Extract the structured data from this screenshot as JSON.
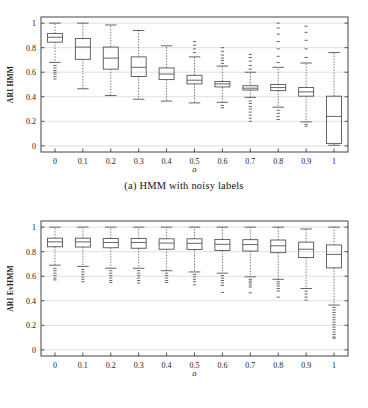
{
  "figure": {
    "caption_a": "(a) HMM with noisy labels",
    "caption_b": "(b) EvHMM with noisy labels"
  },
  "chart_data": [
    {
      "id": "hmm",
      "type": "box",
      "title": "(a) HMM with noisy labels",
      "xlabel": "ρ",
      "ylabel": "ARI HMM",
      "xtick_labels": [
        "0",
        "0.1",
        "0.2",
        "0.3",
        "0.4",
        "0.5",
        "0.6",
        "0.7",
        "0.8",
        "0.9",
        "1"
      ],
      "ytick_labels": [
        "0",
        "0.2",
        "0.4",
        "0.6",
        "0.8",
        "1"
      ],
      "ytick_values": [
        0,
        0.2,
        0.4,
        0.6,
        0.8,
        1
      ],
      "xlim": [
        -0.5,
        10.5
      ],
      "ylim": [
        -0.05,
        1.05
      ],
      "grid": true,
      "grid_axis": "y",
      "legend": "none",
      "categories": [
        0,
        0.1,
        0.2,
        0.3,
        0.4,
        0.5,
        0.6,
        0.7,
        0.8,
        0.9,
        1
      ],
      "boxes": [
        {
          "x": 0,
          "whisker_low": 0.68,
          "q1": 0.845,
          "median": 0.885,
          "q3": 0.915,
          "whisker_high": 1.0,
          "outliers_low": [
            0.655,
            0.635,
            0.615,
            0.6,
            0.585,
            0.565,
            0.545
          ],
          "outliers_high": []
        },
        {
          "x": 0.1,
          "whisker_low": 0.465,
          "q1": 0.705,
          "median": 0.805,
          "q3": 0.875,
          "whisker_high": 1.0,
          "outliers_low": [],
          "outliers_high": []
        },
        {
          "x": 0.2,
          "whisker_low": 0.41,
          "q1": 0.625,
          "median": 0.715,
          "q3": 0.805,
          "whisker_high": 0.985,
          "outliers_low": [],
          "outliers_high": []
        },
        {
          "x": 0.3,
          "whisker_low": 0.38,
          "q1": 0.565,
          "median": 0.64,
          "q3": 0.725,
          "whisker_high": 0.94,
          "outliers_low": [],
          "outliers_high": []
        },
        {
          "x": 0.4,
          "whisker_low": 0.365,
          "q1": 0.54,
          "median": 0.585,
          "q3": 0.635,
          "whisker_high": 0.815,
          "outliers_low": [],
          "outliers_high": []
        },
        {
          "x": 0.5,
          "whisker_low": 0.35,
          "q1": 0.505,
          "median": 0.535,
          "q3": 0.575,
          "whisker_high": 0.725,
          "outliers_low": [],
          "outliers_high": [
            0.76,
            0.79,
            0.82,
            0.85
          ]
        },
        {
          "x": 0.6,
          "whisker_low": 0.355,
          "q1": 0.48,
          "median": 0.505,
          "q3": 0.525,
          "whisker_high": 0.65,
          "outliers_low": [
            0.33,
            0.31
          ],
          "outliers_high": [
            0.672,
            0.695,
            0.715,
            0.74,
            0.77,
            0.8
          ]
        },
        {
          "x": 0.7,
          "whisker_low": 0.395,
          "q1": 0.455,
          "median": 0.47,
          "q3": 0.49,
          "whisker_high": 0.6,
          "outliers_low": [
            0.365,
            0.345,
            0.32,
            0.3,
            0.275,
            0.25,
            0.225,
            0.2
          ],
          "outliers_high": [
            0.625,
            0.655,
            0.69,
            0.72,
            0.745
          ]
        },
        {
          "x": 0.8,
          "whisker_low": 0.315,
          "q1": 0.45,
          "median": 0.475,
          "q3": 0.5,
          "whisker_high": 0.64,
          "outliers_low": [
            0.29,
            0.265,
            0.24,
            0.215
          ],
          "outliers_high": [
            0.68,
            0.73,
            0.79,
            0.85,
            0.91,
            0.96,
            1.0
          ]
        },
        {
          "x": 0.9,
          "whisker_low": 0.195,
          "q1": 0.405,
          "median": 0.44,
          "q3": 0.475,
          "whisker_high": 0.675,
          "outliers_low": [
            0.175,
            0.16
          ],
          "outliers_high": [
            0.72,
            0.79,
            0.86,
            0.925,
            0.975
          ]
        },
        {
          "x": 1,
          "whisker_low": 0.005,
          "q1": 0.02,
          "median": 0.24,
          "q3": 0.405,
          "whisker_high": 0.76,
          "outliers_low": [],
          "outliers_high": []
        }
      ]
    },
    {
      "id": "evhmm",
      "type": "box",
      "title": "(b) EvHMM with noisy labels",
      "xlabel": "ρ",
      "ylabel": "ARI EvHMM",
      "xtick_labels": [
        "0",
        "0.1",
        "0.2",
        "0.3",
        "0.4",
        "0.5",
        "0.6",
        "0.7",
        "0.8",
        "0.9",
        "1"
      ],
      "ytick_labels": [
        "0",
        "0.2",
        "0.4",
        "0.6",
        "0.8",
        "1"
      ],
      "ytick_values": [
        0,
        0.2,
        0.4,
        0.6,
        0.8,
        1
      ],
      "xlim": [
        -0.5,
        10.5
      ],
      "ylim": [
        -0.05,
        1.05
      ],
      "grid": true,
      "grid_axis": "y",
      "legend": "none",
      "categories": [
        0,
        0.1,
        0.2,
        0.3,
        0.4,
        0.5,
        0.6,
        0.7,
        0.8,
        0.9,
        1
      ],
      "boxes": [
        {
          "x": 0,
          "whisker_low": 0.69,
          "q1": 0.84,
          "median": 0.88,
          "q3": 0.91,
          "whisker_high": 1.0,
          "outliers_low": [
            0.665,
            0.645,
            0.625,
            0.605,
            0.585,
            0.57
          ],
          "outliers_high": []
        },
        {
          "x": 0.1,
          "whisker_low": 0.68,
          "q1": 0.838,
          "median": 0.88,
          "q3": 0.91,
          "whisker_high": 1.0,
          "outliers_low": [
            0.655,
            0.635,
            0.615,
            0.595,
            0.575,
            0.555
          ],
          "outliers_high": []
        },
        {
          "x": 0.2,
          "whisker_low": 0.665,
          "q1": 0.832,
          "median": 0.875,
          "q3": 0.908,
          "whisker_high": 1.0,
          "outliers_low": [
            0.645,
            0.625,
            0.605,
            0.585,
            0.565,
            0.548
          ],
          "outliers_high": []
        },
        {
          "x": 0.3,
          "whisker_low": 0.665,
          "q1": 0.828,
          "median": 0.875,
          "q3": 0.908,
          "whisker_high": 1.0,
          "outliers_low": [
            0.645,
            0.625,
            0.605,
            0.585,
            0.565,
            0.545
          ],
          "outliers_high": []
        },
        {
          "x": 0.4,
          "whisker_low": 0.645,
          "q1": 0.82,
          "median": 0.87,
          "q3": 0.905,
          "whisker_high": 1.0,
          "outliers_low": [
            0.625,
            0.605,
            0.585,
            0.565,
            0.548
          ],
          "outliers_high": []
        },
        {
          "x": 0.5,
          "whisker_low": 0.635,
          "q1": 0.818,
          "median": 0.868,
          "q3": 0.905,
          "whisker_high": 1.0,
          "outliers_low": [
            0.615,
            0.595,
            0.575,
            0.555,
            0.53
          ],
          "outliers_high": []
        },
        {
          "x": 0.6,
          "whisker_low": 0.625,
          "q1": 0.81,
          "median": 0.86,
          "q3": 0.9,
          "whisker_high": 1.0,
          "outliers_low": [
            0.605,
            0.585,
            0.565,
            0.545,
            0.525,
            0.468
          ],
          "outliers_high": []
        },
        {
          "x": 0.7,
          "whisker_low": 0.595,
          "q1": 0.805,
          "median": 0.858,
          "q3": 0.898,
          "whisker_high": 1.0,
          "outliers_low": [
            0.575,
            0.56,
            0.545,
            0.528,
            0.512,
            0.465
          ],
          "outliers_high": []
        },
        {
          "x": 0.8,
          "whisker_low": 0.575,
          "q1": 0.792,
          "median": 0.848,
          "q3": 0.895,
          "whisker_high": 1.0,
          "outliers_low": [
            0.555,
            0.538,
            0.52,
            0.5,
            0.48,
            0.43
          ],
          "outliers_high": []
        },
        {
          "x": 0.9,
          "whisker_low": 0.5,
          "q1": 0.752,
          "median": 0.82,
          "q3": 0.878,
          "whisker_high": 0.985,
          "outliers_low": [
            0.478,
            0.455,
            0.43,
            0.405
          ],
          "outliers_high": []
        },
        {
          "x": 1,
          "whisker_low": 0.365,
          "q1": 0.668,
          "median": 0.778,
          "q3": 0.855,
          "whisker_high": 1.0,
          "outliers_low": [
            0.345,
            0.325,
            0.305,
            0.285,
            0.265,
            0.245,
            0.225,
            0.205,
            0.185,
            0.165,
            0.145,
            0.125,
            0.105,
            0.095
          ],
          "outliers_high": []
        }
      ]
    }
  ],
  "style": {
    "axis_color": "#444444",
    "box_color": "#555555",
    "grid_color": "#d8d8d8",
    "background": "#ffffff"
  }
}
